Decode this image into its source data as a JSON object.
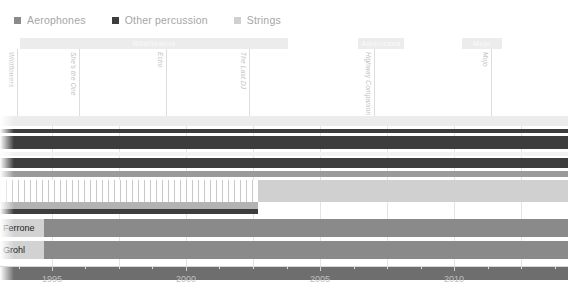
{
  "legend": {
    "items": [
      {
        "label": "Aerophones",
        "color": "#8a8a8a",
        "icon": "square-swatch"
      },
      {
        "label": "Other percussion",
        "color": "#3d3d3d",
        "icon": "square-swatch"
      },
      {
        "label": "Strings",
        "color": "#d0d0d0",
        "icon": "square-swatch"
      }
    ]
  },
  "phases": [
    {
      "label": "Wildflowers",
      "x": 20,
      "width": 268,
      "color": "#ececec",
      "text_color": "#f7f7f7"
    },
    {
      "label": "Americana",
      "x": 358,
      "width": 46,
      "color": "#ececec",
      "text_color": "#f7f7f7"
    },
    {
      "label": "Mojo",
      "x": 462,
      "width": 40,
      "color": "#ececec",
      "text_color": "#f7f7f7"
    }
  ],
  "markers": [
    {
      "label": "Wildflowers",
      "x": 17
    },
    {
      "label": "She's the One",
      "x": 79
    },
    {
      "label": "Echo",
      "x": 166
    },
    {
      "label": "The Last DJ",
      "x": 249
    },
    {
      "label": "Highway Companion",
      "x": 374
    },
    {
      "label": "Mojo",
      "x": 491
    }
  ],
  "axis": {
    "ticks": [
      {
        "label": "1995",
        "x": 52
      },
      {
        "label": "2000",
        "x": 186
      },
      {
        "label": "2005",
        "x": 320
      },
      {
        "label": "2010",
        "x": 454
      }
    ],
    "minor_ticks_x": [
      19,
      85,
      119,
      152,
      219,
      253,
      287,
      354,
      387,
      421,
      488,
      521,
      555
    ],
    "grid_x": [
      52,
      119,
      186,
      253,
      320,
      387,
      454,
      521
    ]
  },
  "chart_data": {
    "type": "bar",
    "title": "",
    "xlabel": "",
    "ylabel": "",
    "xlim": [
      1993.1,
      2012.5
    ],
    "grid": true,
    "legend_position": "top-left",
    "categories": [
      "Aerophones",
      "Other percussion",
      "Strings"
    ],
    "rows": [
      {
        "name": "row-band-1",
        "y": 116,
        "height": 10,
        "x": 0,
        "width": 568,
        "color": "#ececec",
        "label": ""
      },
      {
        "name": "row-band-2",
        "y": 129,
        "height": 4,
        "x": 0,
        "width": 568,
        "color": "#3d3d3d",
        "label": ""
      },
      {
        "name": "row-band-3",
        "y": 136,
        "height": 13,
        "x": 0,
        "width": 568,
        "color": "#3d3d3d",
        "label": ""
      },
      {
        "name": "row-band-4",
        "y": 152,
        "height": 4,
        "x": 0,
        "width": 568,
        "color": "#f2f2f2",
        "label": ""
      },
      {
        "name": "row-band-5",
        "y": 158,
        "height": 10,
        "x": 0,
        "width": 568,
        "color": "#3d3d3d",
        "label": ""
      },
      {
        "name": "row-band-6",
        "y": 171,
        "height": 6,
        "x": 0,
        "width": 568,
        "color": "#9a9a9a",
        "label": ""
      },
      {
        "name": "row-band-7",
        "y": 180,
        "height": 22,
        "x": 0,
        "width": 258,
        "color": "#c9c9c9",
        "label": "",
        "fill": "stripes"
      },
      {
        "name": "row-band-7b",
        "y": 180,
        "height": 22,
        "x": 258,
        "width": 310,
        "color": "#d0d0d0",
        "label": ""
      },
      {
        "name": "row-band-8",
        "y": 202,
        "height": 7,
        "x": 0,
        "width": 258,
        "color": "#b3b3b3",
        "label": ""
      },
      {
        "name": "row-band-9",
        "y": 209,
        "height": 5,
        "x": 0,
        "width": 258,
        "color": "#3d3d3d",
        "label": ""
      },
      {
        "name": "row-ferrone",
        "y": 219,
        "height": 18,
        "x": 0,
        "width": 568,
        "color": "#8a8a8a",
        "label": "Ferrone"
      },
      {
        "name": "row-grohl",
        "y": 241,
        "height": 18,
        "x": 0,
        "width": 568,
        "color": "#8a8a8a",
        "label": "Grohl"
      },
      {
        "name": "row-base",
        "y": 266,
        "height": 14,
        "x": 0,
        "width": 568,
        "color": "#6e6e6e",
        "label": ""
      }
    ],
    "series": [
      {
        "name": "Aerophones",
        "color": "#8a8a8a",
        "values": [
          1,
          1,
          1
        ]
      },
      {
        "name": "Other percussion",
        "color": "#3d3d3d",
        "values": [
          1,
          1,
          1
        ]
      },
      {
        "name": "Strings",
        "color": "#d0d0d0",
        "values": [
          1,
          1,
          1
        ]
      }
    ]
  }
}
